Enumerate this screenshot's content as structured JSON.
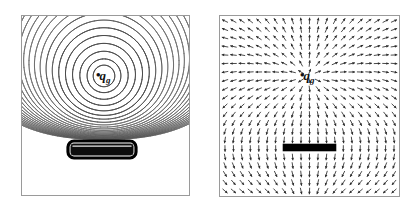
{
  "figure": {
    "width": 415,
    "height": 211,
    "background": "#ffffff"
  },
  "panels": [
    {
      "id": "left-panel",
      "kind": "equipotential-contour-plot",
      "frame": {
        "x": 21,
        "y": 15,
        "width": 169,
        "height": 181
      },
      "frame_color": "#9a9a9a",
      "contour_color": "#4a4a4a",
      "charge": {
        "label_q": "q",
        "label_sub": "g",
        "marker": "•",
        "cx": 104,
        "cy": 76
      },
      "conductor": {
        "shape": "rounded-rectangle",
        "x": 68,
        "y": 141,
        "width": 68,
        "height": 17,
        "fill": "#0d0d0d",
        "stroke": "#000000"
      },
      "contours": {
        "count": 26,
        "type": "concentric-equipotentials",
        "note": "closed loops near charge, compressed and flattened near conductor"
      }
    },
    {
      "id": "right-panel",
      "kind": "vector-field-plot",
      "frame": {
        "x": 219,
        "y": 15,
        "width": 181,
        "height": 182
      },
      "frame_color": "#9a9a9a",
      "arrow_color": "#2b2b2b",
      "charge": {
        "label_q": "q",
        "label_sub": "g",
        "marker": "•",
        "cx": 308,
        "cy": 76
      },
      "conductor": {
        "shape": "rectangle",
        "x": 283,
        "y": 144,
        "width": 53,
        "height": 7,
        "fill": "#000000"
      },
      "grid": {
        "cols": 21,
        "rows": 21
      },
      "note": "arrows point radially away from charge, normal to conductor surface"
    }
  ],
  "chart_data": {
    "type": "scatter",
    "title": "",
    "xlabel": "",
    "ylabel": "",
    "series": [
      {
        "name": "equipotential-contours",
        "panel": "left-panel",
        "levels": 26
      },
      {
        "name": "electric-field-vectors",
        "panel": "right-panel",
        "grid": "21x21"
      }
    ],
    "annotations": [
      "q_g",
      "q_g"
    ],
    "legend": "none",
    "grid": false
  }
}
